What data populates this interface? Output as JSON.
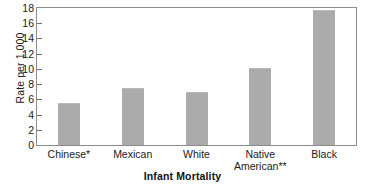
{
  "chart_data": {
    "type": "bar",
    "title": "Infant Mortality",
    "xlabel": "Infant Mortality",
    "ylabel": "Rate per 1,000",
    "categories": [
      "Chinese*",
      "Mexican",
      "White",
      "Native\nAmerican**",
      "Black"
    ],
    "values": [
      5.5,
      7.5,
      7.0,
      10.1,
      17.7
    ],
    "ylim": [
      0,
      18
    ],
    "yticks": [
      0,
      2,
      4,
      6,
      8,
      10,
      12,
      14,
      16,
      18
    ],
    "ytick_labels": [
      "0",
      "2",
      "4",
      "6",
      "8",
      "10",
      "12",
      "14",
      "16",
      "18"
    ],
    "grid": false,
    "legend": "none",
    "bar_color": "#ababab",
    "frame_color": "#8c8c8c",
    "text_color": "#1a1a1a"
  }
}
